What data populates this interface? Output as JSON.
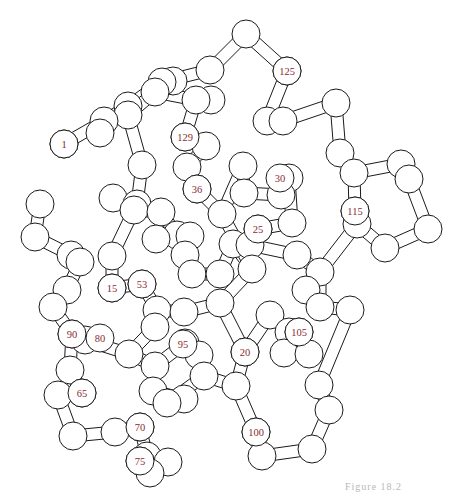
{
  "figure": {
    "type": "protein-backbone-ball-and-stick",
    "caption": "Figure 18.2",
    "label_color": "#8a2a30",
    "line_color": "#1a1a1a",
    "atom_radius": 14,
    "labels": [
      {
        "text": "1",
        "x": 64,
        "y": 144
      },
      {
        "text": "125",
        "x": 287,
        "y": 71
      },
      {
        "text": "129",
        "x": 185,
        "y": 137
      },
      {
        "text": "36",
        "x": 197,
        "y": 189
      },
      {
        "text": "30",
        "x": 280,
        "y": 178
      },
      {
        "text": "25",
        "x": 258,
        "y": 229
      },
      {
        "text": "115",
        "x": 355,
        "y": 211
      },
      {
        "text": "15",
        "x": 112,
        "y": 288
      },
      {
        "text": "53",
        "x": 142,
        "y": 284
      },
      {
        "text": "90",
        "x": 72,
        "y": 334
      },
      {
        "text": "80",
        "x": 100,
        "y": 338
      },
      {
        "text": "95",
        "x": 183,
        "y": 344
      },
      {
        "text": "105",
        "x": 299,
        "y": 332
      },
      {
        "text": "20",
        "x": 245,
        "y": 352
      },
      {
        "text": "65",
        "x": 82,
        "y": 393
      },
      {
        "text": "70",
        "x": 140,
        "y": 427
      },
      {
        "text": "75",
        "x": 140,
        "y": 461
      },
      {
        "text": "100",
        "x": 256,
        "y": 432
      }
    ],
    "atoms": [
      [
        64,
        144
      ],
      [
        104,
        121
      ],
      [
        100,
        133
      ],
      [
        128,
        106
      ],
      [
        162,
        82
      ],
      [
        173,
        81
      ],
      [
        210,
        70
      ],
      [
        211,
        100
      ],
      [
        246,
        34
      ],
      [
        287,
        71
      ],
      [
        267,
        121
      ],
      [
        283,
        121
      ],
      [
        336,
        103
      ],
      [
        340,
        153
      ],
      [
        354,
        173
      ],
      [
        401,
        164
      ],
      [
        409,
        179
      ],
      [
        428,
        229
      ],
      [
        385,
        248
      ],
      [
        355,
        211
      ],
      [
        357,
        224
      ],
      [
        128,
        115
      ],
      [
        155,
        92
      ],
      [
        196,
        100
      ],
      [
        185,
        137
      ],
      [
        206,
        146
      ],
      [
        187,
        167
      ],
      [
        197,
        189
      ],
      [
        222,
        214
      ],
      [
        243,
        166
      ],
      [
        244,
        193
      ],
      [
        281,
        195
      ],
      [
        289,
        178
      ],
      [
        292,
        223
      ],
      [
        258,
        229
      ],
      [
        250,
        245
      ],
      [
        297,
        255
      ],
      [
        320,
        272
      ],
      [
        306,
        290
      ],
      [
        142,
        165
      ],
      [
        137,
        204
      ],
      [
        113,
        198
      ],
      [
        134,
        210
      ],
      [
        161,
        212
      ],
      [
        177,
        235
      ],
      [
        156,
        239
      ],
      [
        190,
        236
      ],
      [
        40,
        204
      ],
      [
        35,
        237
      ],
      [
        71,
        255
      ],
      [
        80,
        262
      ],
      [
        67,
        290
      ],
      [
        53,
        307
      ],
      [
        112,
        288
      ],
      [
        112,
        256
      ],
      [
        142,
        284
      ],
      [
        157,
        310
      ],
      [
        184,
        312
      ],
      [
        155,
        327
      ],
      [
        185,
        255
      ],
      [
        192,
        274
      ],
      [
        220,
        274
      ],
      [
        233,
        244
      ],
      [
        252,
        269
      ],
      [
        72,
        334
      ],
      [
        85,
        340
      ],
      [
        129,
        354
      ],
      [
        155,
        366
      ],
      [
        185,
        343
      ],
      [
        199,
        355
      ],
      [
        204,
        376
      ],
      [
        167,
        403
      ],
      [
        153,
        391
      ],
      [
        184,
        399
      ],
      [
        70,
        370
      ],
      [
        82,
        393
      ],
      [
        58,
        395
      ],
      [
        73,
        436
      ],
      [
        115,
        432
      ],
      [
        140,
        427
      ],
      [
        147,
        456
      ],
      [
        140,
        461
      ],
      [
        150,
        473
      ],
      [
        168,
        462
      ],
      [
        220,
        303
      ],
      [
        245,
        352
      ],
      [
        270,
        315
      ],
      [
        289,
        332
      ],
      [
        299,
        332
      ],
      [
        284,
        353
      ],
      [
        309,
        354
      ],
      [
        236,
        386
      ],
      [
        256,
        432
      ],
      [
        262,
        456
      ],
      [
        312,
        449
      ],
      [
        329,
        410
      ],
      [
        319,
        385
      ],
      [
        350,
        310
      ],
      [
        320,
        307
      ]
    ],
    "bonds": [
      [
        0,
        1
      ],
      [
        1,
        3
      ],
      [
        3,
        4
      ],
      [
        4,
        6
      ],
      [
        6,
        8
      ],
      [
        8,
        9
      ],
      [
        9,
        10
      ],
      [
        10,
        11
      ],
      [
        11,
        12
      ],
      [
        12,
        13
      ],
      [
        13,
        14
      ],
      [
        14,
        15
      ],
      [
        15,
        16
      ],
      [
        16,
        17
      ],
      [
        17,
        18
      ],
      [
        18,
        20
      ],
      [
        19,
        20
      ],
      [
        19,
        14
      ],
      [
        3,
        21
      ],
      [
        21,
        22
      ],
      [
        22,
        23
      ],
      [
        23,
        24
      ],
      [
        24,
        25
      ],
      [
        25,
        26
      ],
      [
        26,
        27
      ],
      [
        27,
        28
      ],
      [
        28,
        29
      ],
      [
        29,
        30
      ],
      [
        30,
        31
      ],
      [
        31,
        32
      ],
      [
        32,
        33
      ],
      [
        33,
        34
      ],
      [
        34,
        35
      ],
      [
        35,
        36
      ],
      [
        36,
        37
      ],
      [
        37,
        38
      ],
      [
        38,
        20
      ],
      [
        21,
        39
      ],
      [
        39,
        40
      ],
      [
        40,
        41
      ],
      [
        40,
        42
      ],
      [
        42,
        43
      ],
      [
        43,
        44
      ],
      [
        44,
        45
      ],
      [
        44,
        46
      ],
      [
        47,
        48
      ],
      [
        48,
        49
      ],
      [
        49,
        50
      ],
      [
        50,
        51
      ],
      [
        51,
        52
      ],
      [
        52,
        64
      ],
      [
        53,
        54
      ],
      [
        54,
        42
      ],
      [
        53,
        55
      ],
      [
        55,
        56
      ],
      [
        56,
        57
      ],
      [
        56,
        58
      ],
      [
        46,
        59
      ],
      [
        59,
        60
      ],
      [
        60,
        61
      ],
      [
        61,
        62
      ],
      [
        62,
        63
      ],
      [
        63,
        28
      ],
      [
        64,
        65
      ],
      [
        65,
        66
      ],
      [
        66,
        67
      ],
      [
        67,
        68
      ],
      [
        68,
        69
      ],
      [
        69,
        70
      ],
      [
        70,
        71
      ],
      [
        71,
        72
      ],
      [
        72,
        73
      ],
      [
        64,
        74
      ],
      [
        74,
        75
      ],
      [
        75,
        76
      ],
      [
        76,
        77
      ],
      [
        77,
        78
      ],
      [
        78,
        79
      ],
      [
        79,
        80
      ],
      [
        80,
        81
      ],
      [
        81,
        82
      ],
      [
        82,
        83
      ],
      [
        57,
        84
      ],
      [
        84,
        85
      ],
      [
        85,
        86
      ],
      [
        86,
        87
      ],
      [
        87,
        88
      ],
      [
        88,
        89
      ],
      [
        89,
        90
      ],
      [
        85,
        91
      ],
      [
        91,
        92
      ],
      [
        92,
        93
      ],
      [
        93,
        94
      ],
      [
        94,
        95
      ],
      [
        95,
        96
      ],
      [
        96,
        97
      ],
      [
        97,
        98
      ],
      [
        98,
        37
      ],
      [
        70,
        91
      ],
      [
        63,
        84
      ],
      [
        58,
        66
      ]
    ]
  }
}
